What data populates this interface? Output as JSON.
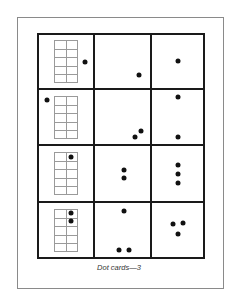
{
  "caption": "Dot cards—3",
  "colors": {
    "line": "#1a1a1a",
    "grid": "#9a9a9a",
    "dot": "#111111",
    "frame": "#8a8a8a"
  },
  "cards": [
    {
      "row": 1,
      "col": 1,
      "type": "ten-frame",
      "dots_outside": 1,
      "dots_in_frame": 0
    },
    {
      "row": 1,
      "col": 2,
      "type": "dots",
      "count": 1
    },
    {
      "row": 1,
      "col": 3,
      "type": "dots",
      "count": 1
    },
    {
      "row": 2,
      "col": 1,
      "type": "ten-frame",
      "dots_outside": 1,
      "dots_in_frame": 0
    },
    {
      "row": 2,
      "col": 2,
      "type": "dots",
      "count": 2
    },
    {
      "row": 2,
      "col": 3,
      "type": "dots",
      "count": 2
    },
    {
      "row": 3,
      "col": 1,
      "type": "ten-frame",
      "dots_outside": 0,
      "dots_in_frame": 1
    },
    {
      "row": 3,
      "col": 2,
      "type": "dots",
      "count": 2
    },
    {
      "row": 3,
      "col": 3,
      "type": "dots",
      "count": 3
    },
    {
      "row": 4,
      "col": 1,
      "type": "ten-frame",
      "dots_outside": 0,
      "dots_in_frame": 2
    },
    {
      "row": 4,
      "col": 2,
      "type": "dots",
      "count": 3
    },
    {
      "row": 4,
      "col": 3,
      "type": "dots",
      "count": 3
    }
  ]
}
